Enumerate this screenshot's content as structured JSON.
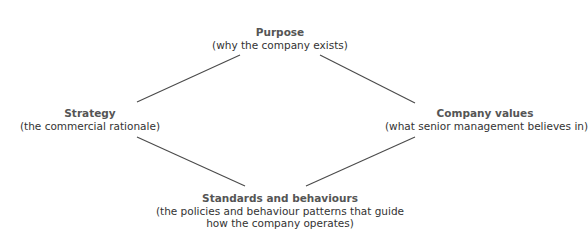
{
  "diagram": {
    "nodes": {
      "purpose": {
        "title": "Purpose",
        "subtitle": "(why the company exists)"
      },
      "strategy": {
        "title": "Strategy",
        "subtitle": "(the commercial rationale)"
      },
      "values": {
        "title": "Company values",
        "subtitle": "(what senior management believes in)"
      },
      "standards": {
        "title": "Standards and behaviours",
        "subtitle_line1": "(the policies and behaviour patterns that guide",
        "subtitle_line2": "how the company operates)"
      }
    },
    "edges": [
      {
        "from": "strategy",
        "to": "purpose"
      },
      {
        "from": "purpose",
        "to": "values"
      },
      {
        "from": "strategy",
        "to": "standards"
      },
      {
        "from": "standards",
        "to": "values"
      }
    ],
    "line_color": "#4a4a4a"
  }
}
